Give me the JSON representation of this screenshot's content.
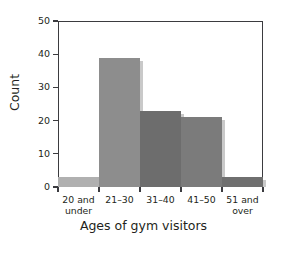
{
  "chart_data": {
    "type": "bar",
    "title": "",
    "subtitle": "",
    "xlabel": "Ages of gym visitors",
    "ylabel": "Count",
    "categories": [
      "20 and under",
      "21–30",
      "31–40",
      "41–50",
      "51 and over"
    ],
    "category_lines": [
      [
        "20 and",
        "under"
      ],
      [
        "21–30",
        ""
      ],
      [
        "31–40",
        ""
      ],
      [
        "41–50",
        ""
      ],
      [
        "51 and",
        "over"
      ]
    ],
    "values": [
      3,
      39,
      23,
      21,
      3
    ],
    "bar_colors": [
      "#b0b0b0",
      "#8d8d8d",
      "#6d6d6d",
      "#7b7b7b",
      "#6f6f6f"
    ],
    "ylim": [
      0,
      50
    ],
    "ytick_values": [
      50,
      40,
      30,
      20,
      10,
      0
    ],
    "ytick_labels": [
      "50",
      "40",
      "30",
      "20",
      "10",
      "0"
    ],
    "xlim_note": "contiguous histogram bins",
    "grid": false,
    "legend": null,
    "annotations": [],
    "frame_color": "#3b3b3f",
    "background_color": "#ffffff",
    "text_color": "#231f20"
  }
}
